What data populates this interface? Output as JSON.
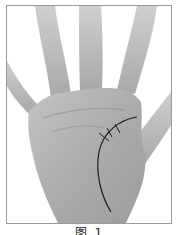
{
  "figure": {
    "caption": "图 1",
    "colors": {
      "background": "#ffffff",
      "frame_border": "#9a9a9a",
      "skin_light": "#bdbdbd",
      "skin_mid": "#a9a9a9",
      "skin_dark": "#8e8e8e",
      "drawn_line": "#1e1e1e"
    },
    "annotations": [
      {
        "type": "curve",
        "description": "life-line arc from between thumb and index down to wrist"
      },
      {
        "type": "tick",
        "count": 3,
        "description": "short cross marks on upper part of arc"
      }
    ]
  }
}
